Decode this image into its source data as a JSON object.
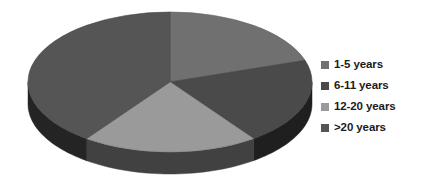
{
  "chart_data": {
    "type": "pie",
    "title": "",
    "categories": [
      "1-5 years",
      "6-11 years",
      "12-20 years",
      ">20 years"
    ],
    "values": [
      20,
      20,
      20,
      40
    ],
    "units": "percent",
    "start_angle_deg": 0,
    "direction": "clockwise",
    "three_d": true,
    "legend_position": "right",
    "grid": false,
    "colors": [
      "#707070",
      "#4a4a4a",
      "#9a9a9a",
      "#555555"
    ],
    "slices": [
      {
        "label": "1-5 years",
        "value": 20,
        "color": "#707070",
        "angle_deg": 72
      },
      {
        "label": "6-11 years",
        "value": 20,
        "color": "#4a4a4a",
        "angle_deg": 72
      },
      {
        "label": "12-20 years",
        "value": 20,
        "color": "#9a9a9a",
        "angle_deg": 72
      },
      {
        "label": ">20 years",
        "value": 40,
        "color": "#555555",
        "angle_deg": 144
      }
    ]
  },
  "legend": {
    "items": [
      {
        "label": "1-5 years",
        "color": "#707070"
      },
      {
        "label": "6-11 years",
        "color": "#4a4a4a"
      },
      {
        "label": "12-20 years",
        "color": "#9a9a9a"
      },
      {
        "label": ">20 years",
        "color": "#555555"
      }
    ]
  },
  "style": {
    "background": "#ffffff",
    "wall_right": "#111111",
    "wall_bottom_left": "#6a6a6a",
    "wall_light_slice": "#5f5f5f",
    "text_color": "#1b1b1b"
  }
}
